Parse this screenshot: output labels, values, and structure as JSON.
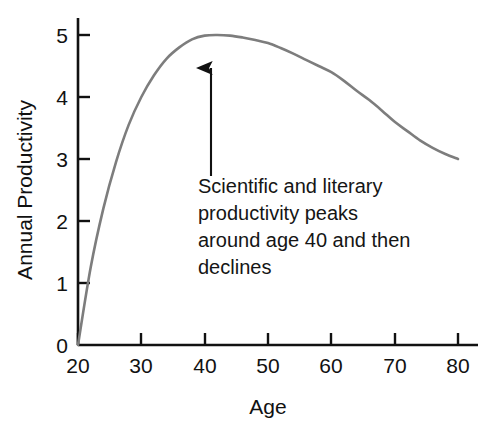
{
  "chart_data": {
    "type": "line",
    "title": "",
    "subtitle": "",
    "xlabel": "Age",
    "ylabel": "Annual Productivity",
    "xlim": [
      20,
      80
    ],
    "ylim": [
      0,
      5
    ],
    "grid": false,
    "legend": false,
    "legend_position": "none",
    "x_ticks": [
      20,
      30,
      40,
      50,
      60,
      70,
      80
    ],
    "x_tick_labels": [
      "20",
      "30",
      "40",
      "50",
      "60",
      "70",
      "80"
    ],
    "y_ticks": [
      0,
      1,
      2,
      3,
      4,
      5
    ],
    "y_tick_labels": [
      "0",
      "1",
      "2",
      "3",
      "4",
      "5"
    ],
    "series": [
      {
        "name": "Annual Productivity",
        "color": "#7d7d7d",
        "line_width": 2.6,
        "x": [
          20,
          22,
          24,
          26,
          28,
          30,
          32,
          34,
          36,
          38,
          40,
          42,
          44,
          46,
          48,
          50,
          52,
          54,
          56,
          58,
          60,
          62,
          64,
          66,
          68,
          70,
          72,
          74,
          76,
          78,
          80
        ],
        "values": [
          0.0,
          1.25,
          2.2,
          2.95,
          3.55,
          4.0,
          4.35,
          4.62,
          4.8,
          4.93,
          4.99,
          5.0,
          4.99,
          4.96,
          4.92,
          4.87,
          4.79,
          4.7,
          4.6,
          4.5,
          4.4,
          4.26,
          4.1,
          3.95,
          3.78,
          3.6,
          3.45,
          3.3,
          3.18,
          3.08,
          3.0
        ]
      }
    ],
    "annotations": [
      {
        "name": "peak-callout",
        "kind": "arrow-with-text",
        "arrow_color": "#111111",
        "points_to_x": 42,
        "points_to_y": 5.0,
        "text_lines": [
          "Scientific and literary",
          "productivity peaks",
          "around age 40 and then",
          "declines"
        ]
      }
    ]
  },
  "axes": {
    "x_axis_label": "Age",
    "y_axis_label": "Annual Productivity",
    "axis_color": "#111111"
  },
  "colors": {
    "background": "#ffffff",
    "curve": "#7d7d7d",
    "axis": "#111111",
    "text": "#111111",
    "arrow": "#111111"
  }
}
